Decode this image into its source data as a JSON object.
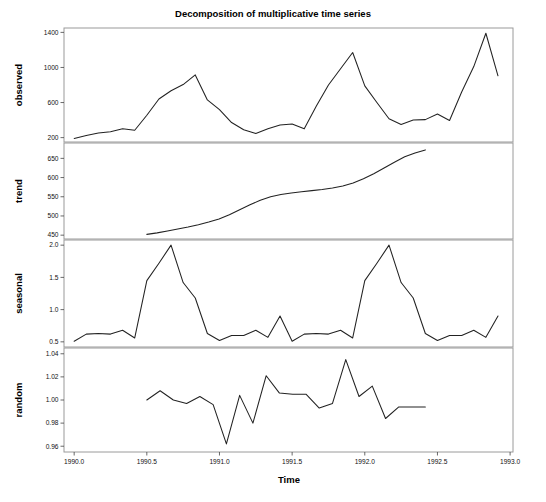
{
  "chart_data": {
    "type": "line",
    "title": "Decomposition of multiplicative time series",
    "xlabel": "Time",
    "ylabel": "",
    "xlim": [
      1989.93,
      1993.02
    ],
    "grid": false,
    "legend": "none",
    "x_ticks": [
      "1990.0",
      "1990.5",
      "1991.0",
      "1991.5",
      "1992.0",
      "1992.5",
      "1993.0"
    ],
    "x_tick_values": [
      1990.0,
      1990.5,
      1991.0,
      1991.5,
      1992.0,
      1992.5,
      1993.0
    ],
    "panels": [
      {
        "name": "observed",
        "ylabel": "observed",
        "ylim": [
          150,
          1450
        ],
        "y_ticks": [
          "200",
          "600",
          "1000",
          "1400"
        ],
        "y_tick_values": [
          200,
          600,
          1000,
          1400
        ],
        "x": [
          1990.0,
          1990.0833,
          1990.1667,
          1990.25,
          1990.3333,
          1990.4167,
          1990.5,
          1990.5833,
          1990.6667,
          1990.75,
          1990.8333,
          1990.9167,
          1991.0,
          1991.0833,
          1991.1667,
          1991.25,
          1991.3333,
          1991.4167,
          1991.5,
          1991.5833,
          1991.6667,
          1991.75,
          1991.8333,
          1991.9167,
          1992.0,
          1992.0833,
          1992.1667,
          1992.25,
          1992.3333,
          1992.4167,
          1992.5,
          1992.5833,
          1992.6667,
          1992.75,
          1992.8333,
          1992.9167
        ],
        "values": [
          190,
          225,
          252,
          268,
          300,
          284,
          455,
          640,
          735,
          805,
          915,
          630,
          520,
          372,
          290,
          248,
          300,
          345,
          355,
          300,
          560,
          800,
          985,
          1170,
          790,
          600,
          415,
          350,
          400,
          405,
          470,
          395,
          720,
          1010,
          1390,
          905,
          630,
          430
        ],
        "series_values": [
          190,
          225,
          252,
          268,
          300,
          284,
          455,
          640,
          735,
          805,
          915,
          630,
          520,
          372,
          290,
          248,
          300,
          345,
          355,
          300,
          560,
          800,
          985,
          1170,
          790,
          600,
          415,
          350,
          400,
          405,
          470,
          395,
          720,
          1010,
          1390,
          905,
          630,
          430
        ]
      },
      {
        "name": "trend",
        "ylabel": "trend",
        "ylim": [
          440,
          690
        ],
        "y_ticks": [
          "450",
          "500",
          "550",
          "600",
          "650"
        ],
        "y_tick_values": [
          450,
          500,
          550,
          600,
          650
        ],
        "x_start": 1990.5,
        "x_end": 1992.4167,
        "values": [
          452,
          456,
          461,
          466,
          471,
          477,
          484,
          492,
          503,
          516,
          529,
          541,
          550,
          556,
          560,
          563,
          566,
          569,
          573,
          578,
          586,
          597,
          610,
          625,
          640,
          654,
          664,
          672
        ]
      },
      {
        "name": "seasonal",
        "ylabel": "seasonal",
        "ylim": [
          0.42,
          2.08
        ],
        "y_ticks": [
          "0.5",
          "1.0",
          "1.5",
          "2.0"
        ],
        "y_tick_values": [
          0.5,
          1.0,
          1.5,
          2.0
        ],
        "x_start": 1990.0,
        "x_end": 1992.9167,
        "values": [
          0.51,
          0.62,
          0.63,
          0.62,
          0.68,
          0.56,
          1.45,
          1.72,
          2.0,
          1.42,
          1.18,
          0.63,
          0.52,
          0.6,
          0.6,
          0.68,
          0.57,
          0.9,
          0.51,
          0.62,
          0.63,
          0.62,
          0.68,
          0.56,
          1.45,
          1.72,
          2.0,
          1.42,
          1.18,
          0.63,
          0.52,
          0.6,
          0.6,
          0.68,
          0.57,
          0.9
        ]
      },
      {
        "name": "random",
        "ylabel": "random",
        "ylim": [
          0.955,
          1.045
        ],
        "y_ticks": [
          "0.96",
          "0.98",
          "1.00",
          "1.02",
          "1.04"
        ],
        "y_tick_values": [
          0.96,
          0.98,
          1.0,
          1.02,
          1.04
        ],
        "x_start": 1990.5,
        "x_end": 1992.4167,
        "values": [
          1.0,
          1.008,
          1.0,
          0.997,
          1.003,
          0.996,
          0.962,
          1.004,
          0.98,
          1.021,
          1.006,
          1.005,
          1.005,
          0.993,
          0.997,
          1.035,
          1.003,
          1.012,
          0.984,
          0.994,
          0.994,
          0.994
        ]
      }
    ]
  },
  "caption": {
    "line1": ""
  }
}
